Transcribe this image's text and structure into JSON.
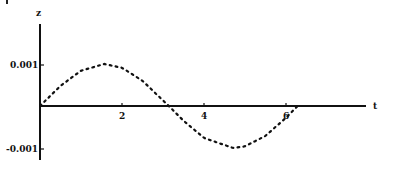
{
  "chart_data": {
    "type": "line",
    "title": "",
    "xlabel": "t",
    "ylabel": "z",
    "xlim": [
      0,
      7.9
    ],
    "ylim": [
      -0.0013,
      0.002
    ],
    "x_ticks": [
      2,
      4,
      6
    ],
    "x_tick_labels": [
      "2",
      "4",
      "6"
    ],
    "y_ticks": [
      0.001,
      -0.001
    ],
    "y_tick_labels": [
      "0.001",
      "-0.001"
    ],
    "grid": false,
    "legend": null,
    "line_style": "dotted",
    "series": [
      {
        "name": "z(t)",
        "formula": "z = 0.001 * sin(t)",
        "x": [
          0,
          0.5,
          1.0,
          1.5708,
          2.0,
          2.5,
          3.1416,
          3.5,
          4.0,
          4.7124,
          5.0,
          5.5,
          6.0,
          6.2832
        ],
        "values": [
          0,
          0.00048,
          0.00084,
          0.001,
          0.00091,
          0.0006,
          0,
          -0.00035,
          -0.00076,
          -0.001,
          -0.00096,
          -0.00071,
          -0.00028,
          0
        ]
      }
    ]
  }
}
